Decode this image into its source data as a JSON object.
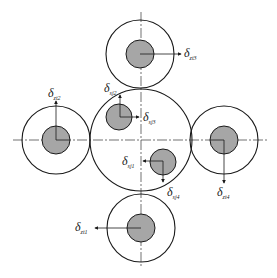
{
  "diagram": {
    "type": "gear-arrangement-schematic",
    "colors": {
      "stroke": "#1a1a1a",
      "fill_shaft": "#a6a6a6",
      "background": "#ffffff"
    },
    "central_gear": {
      "cx": 141,
      "cy": 140,
      "r": 51
    },
    "planet_gears": [
      {
        "id": "top",
        "cx": 140,
        "cy": 54,
        "r_outer": 34,
        "r_inner": 14
      },
      {
        "id": "left",
        "cx": 56,
        "cy": 140,
        "r_outer": 34,
        "r_inner": 14
      },
      {
        "id": "right",
        "cx": 224,
        "cy": 140,
        "r_outer": 34,
        "r_inner": 14
      },
      {
        "id": "bottom",
        "cx": 141,
        "cy": 228,
        "r_outer": 34,
        "r_inner": 14
      }
    ],
    "inner_shafts": [
      {
        "id": "upper-left",
        "cx": 119,
        "cy": 117,
        "r": 13
      },
      {
        "id": "lower-right",
        "cx": 163,
        "cy": 162,
        "r": 13
      }
    ],
    "labels": {
      "zt1": {
        "symbol": "δ",
        "sub": "zt1"
      },
      "zt2": {
        "symbol": "δ",
        "sub": "zt2"
      },
      "zt3": {
        "symbol": "δ",
        "sub": "zt3"
      },
      "zt4": {
        "symbol": "δ",
        "sub": "zt4"
      },
      "sj1": {
        "symbol": "δ",
        "sub": "sj1"
      },
      "sj2": {
        "symbol": "δ",
        "sub": "sj2"
      },
      "sj3": {
        "symbol": "δ",
        "sub": "sj3"
      },
      "sj4": {
        "symbol": "δ",
        "sub": "sj4"
      }
    }
  }
}
